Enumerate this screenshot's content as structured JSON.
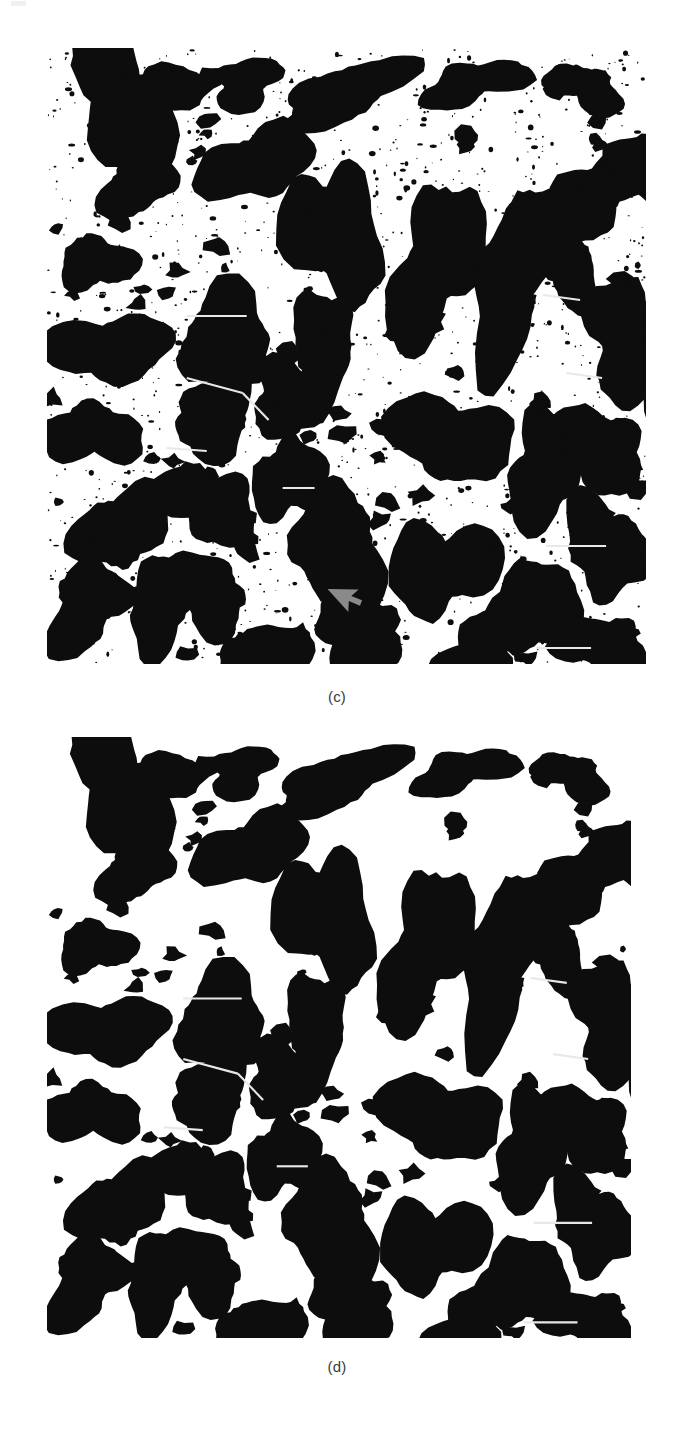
{
  "figure": {
    "kind": "binary-segmentation-micrograph-pair",
    "background_color": "#ffffff",
    "particle_color": "#0d0d0d",
    "separator_line_color": "#e8e8e8",
    "annotation_arrow_color": "#8a8a8a",
    "panels": [
      {
        "id": "c",
        "caption": "(c)",
        "label": "(c)",
        "description": "Binary segmented grain map with residual speckle noise and a gray pointer arrow annotation",
        "x": 47,
        "y": 48,
        "width": 599,
        "height": 616,
        "noise": true,
        "noise_density": 1.0,
        "arrow": {
          "visible": true,
          "x": 281,
          "y": 541,
          "size": 29,
          "rotation": -42,
          "color": "#8a8a8a"
        }
      },
      {
        "id": "d",
        "caption": "(d)",
        "label": "(d)",
        "description": "Cleaned binary segmented grain map, speckle noise removed",
        "x": 47,
        "y": 737,
        "width": 584,
        "height": 601,
        "noise": false,
        "noise_density": 0.0,
        "arrow": {
          "visible": false
        }
      }
    ]
  },
  "captions": {
    "panel_c": "(c)",
    "panel_d": "(d)"
  },
  "chart_data": {
    "type": "heatmap",
    "title": "",
    "xlabel": "",
    "ylabel": "",
    "grains": [
      {
        "cx": 75,
        "cy": 50,
        "rx": 52,
        "ry": 68,
        "rot": -18,
        "seed": 11
      },
      {
        "cx": 92,
        "cy": 135,
        "rx": 36,
        "ry": 33,
        "rot": 14,
        "seed": 12
      },
      {
        "cx": 50,
        "cy": 215,
        "rx": 34,
        "ry": 30,
        "rot": -5,
        "seed": 13
      },
      {
        "cx": 63,
        "cy": 300,
        "rx": 55,
        "ry": 38,
        "rot": -12,
        "seed": 14
      },
      {
        "cx": 45,
        "cy": 386,
        "rx": 44,
        "ry": 35,
        "rot": 8,
        "seed": 15
      },
      {
        "cx": 75,
        "cy": 480,
        "rx": 43,
        "ry": 44,
        "rot": 20,
        "seed": 16
      },
      {
        "cx": 40,
        "cy": 558,
        "rx": 40,
        "ry": 42,
        "rot": -10,
        "seed": 17
      },
      {
        "cx": 115,
        "cy": 555,
        "rx": 35,
        "ry": 47,
        "rot": 12,
        "seed": 18
      },
      {
        "cx": 108,
        "cy": 40,
        "rx": 48,
        "ry": 26,
        "rot": 6,
        "seed": 19
      },
      {
        "cx": 200,
        "cy": 35,
        "rx": 38,
        "ry": 22,
        "rot": -8,
        "seed": 20
      },
      {
        "cx": 210,
        "cy": 115,
        "rx": 52,
        "ry": 40,
        "rot": -25,
        "seed": 21
      },
      {
        "cx": 180,
        "cy": 290,
        "rx": 52,
        "ry": 44,
        "rot": 16,
        "seed": 22
      },
      {
        "cx": 167,
        "cy": 370,
        "rx": 44,
        "ry": 36,
        "rot": -5,
        "seed": 23
      },
      {
        "cx": 238,
        "cy": 353,
        "rx": 37,
        "ry": 33,
        "rot": 10,
        "seed": 24
      },
      {
        "cx": 160,
        "cy": 455,
        "rx": 44,
        "ry": 43,
        "rot": -14,
        "seed": 25
      },
      {
        "cx": 163,
        "cy": 545,
        "rx": 40,
        "ry": 36,
        "rot": 18,
        "seed": 26
      },
      {
        "cx": 213,
        "cy": 612,
        "rx": 40,
        "ry": 40,
        "rot": -9,
        "seed": 27
      },
      {
        "cx": 300,
        "cy": 45,
        "rx": 60,
        "ry": 30,
        "rot": -20,
        "seed": 28
      },
      {
        "cx": 288,
        "cy": 185,
        "rx": 42,
        "ry": 78,
        "rot": -12,
        "seed": 29
      },
      {
        "cx": 276,
        "cy": 300,
        "rx": 34,
        "ry": 52,
        "rot": 8,
        "seed": 30
      },
      {
        "cx": 243,
        "cy": 430,
        "rx": 32,
        "ry": 46,
        "rot": -6,
        "seed": 31
      },
      {
        "cx": 291,
        "cy": 500,
        "rx": 47,
        "ry": 59,
        "rot": 14,
        "seed": 32
      },
      {
        "cx": 312,
        "cy": 585,
        "rx": 48,
        "ry": 41,
        "rot": -10,
        "seed": 33
      },
      {
        "cx": 390,
        "cy": 215,
        "rx": 46,
        "ry": 74,
        "rot": 10,
        "seed": 34
      },
      {
        "cx": 405,
        "cy": 390,
        "rx": 52,
        "ry": 50,
        "rot": -8,
        "seed": 35
      },
      {
        "cx": 395,
        "cy": 520,
        "rx": 45,
        "ry": 56,
        "rot": 12,
        "seed": 36
      },
      {
        "cx": 430,
        "cy": 605,
        "rx": 40,
        "ry": 34,
        "rot": -15,
        "seed": 37
      },
      {
        "cx": 468,
        "cy": 230,
        "rx": 40,
        "ry": 88,
        "rot": 8,
        "seed": 38
      },
      {
        "cx": 500,
        "cy": 420,
        "rx": 42,
        "ry": 52,
        "rot": -10,
        "seed": 39
      },
      {
        "cx": 487,
        "cy": 560,
        "rx": 40,
        "ry": 56,
        "rot": 14,
        "seed": 40
      },
      {
        "cx": 428,
        "cy": 35,
        "rx": 46,
        "ry": 24,
        "rot": -12,
        "seed": 41
      },
      {
        "cx": 540,
        "cy": 40,
        "rx": 34,
        "ry": 24,
        "rot": 10,
        "seed": 42
      },
      {
        "cx": 552,
        "cy": 145,
        "rx": 50,
        "ry": 40,
        "rot": -30,
        "seed": 43
      },
      {
        "cx": 523,
        "cy": 220,
        "rx": 28,
        "ry": 40,
        "rot": 5,
        "seed": 44
      },
      {
        "cx": 578,
        "cy": 290,
        "rx": 38,
        "ry": 58,
        "rot": 16,
        "seed": 45
      },
      {
        "cx": 552,
        "cy": 400,
        "rx": 42,
        "ry": 45,
        "rot": -12,
        "seed": 46
      },
      {
        "cx": 560,
        "cy": 500,
        "rx": 40,
        "ry": 50,
        "rot": 10,
        "seed": 47
      },
      {
        "cx": 556,
        "cy": 598,
        "rx": 40,
        "ry": 34,
        "rot": -8,
        "seed": 48
      },
      {
        "cx": 600,
        "cy": 120,
        "rx": 36,
        "ry": 34,
        "rot": 6,
        "seed": 49
      },
      {
        "cx": 612,
        "cy": 330,
        "rx": 34,
        "ry": 46,
        "rot": -16,
        "seed": 50
      }
    ],
    "split_lines": [
      {
        "x1": 140,
        "y1": 268,
        "x2": 200,
        "y2": 268
      },
      {
        "x1": 140,
        "y1": 330,
        "x2": 196,
        "y2": 345
      },
      {
        "x1": 120,
        "y1": 400,
        "x2": 160,
        "y2": 403
      },
      {
        "x1": 196,
        "y1": 345,
        "x2": 222,
        "y2": 372
      },
      {
        "x1": 236,
        "y1": 440,
        "x2": 268,
        "y2": 440
      },
      {
        "x1": 500,
        "y1": 498,
        "x2": 560,
        "y2": 498
      },
      {
        "x1": 490,
        "y1": 600,
        "x2": 545,
        "y2": 600
      },
      {
        "x1": 497,
        "y1": 247,
        "x2": 534,
        "y2": 252
      },
      {
        "x1": 520,
        "y1": 325,
        "x2": 556,
        "y2": 330
      }
    ],
    "legend": [],
    "grid": false
  }
}
